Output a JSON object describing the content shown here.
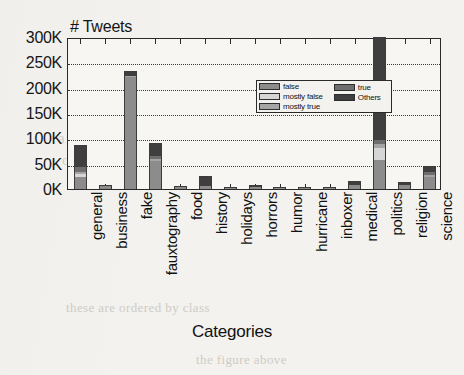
{
  "figure": {
    "y_axis_title": "# Tweets",
    "x_axis_title": "Categories"
  },
  "legend": {
    "left_column": [
      {
        "label": "false",
        "color": "#8c8c8c"
      },
      {
        "label": "mostly false",
        "color": "#d6d6d6"
      },
      {
        "label": "mostly true",
        "color": "#a5a5a5"
      }
    ],
    "right_column": [
      {
        "label": "true",
        "color": "#6e6e6e"
      },
      {
        "label": "Others",
        "color": "#3f3f3f"
      }
    ]
  },
  "ghost_text": {
    "line1": "and supporters among",
    "line2": "a representative sample of",
    "line3": "of the tweets we collect",
    "line4": "these are ordered by class",
    "line5": "the figure above"
  },
  "chart_data": {
    "type": "bar",
    "title": "",
    "subtitle": "",
    "xlabel": "Categories",
    "ylabel": "# Tweets",
    "stacked": true,
    "grid": true,
    "legend_position": "inside-top-center",
    "ylim": [
      0,
      300000
    ],
    "ytick_values": [
      0,
      50000,
      100000,
      150000,
      200000,
      250000,
      300000
    ],
    "ytick_labels": [
      "0K",
      "50K",
      "100K",
      "150K",
      "200K",
      "250K",
      "300K"
    ],
    "categories": [
      "general",
      "business",
      "fake",
      "fauxtography",
      "food",
      "history",
      "holidays",
      "horrors",
      "humor",
      "hurricane",
      "inboxer",
      "medical",
      "politics",
      "religion",
      "science"
    ],
    "series": [
      {
        "name": "false",
        "color": "#8c8c8c",
        "values": [
          23000,
          6000,
          222000,
          56000,
          3000,
          6000,
          2000,
          4000,
          1000,
          1000,
          2000,
          7000,
          57000,
          8000,
          24000
        ]
      },
      {
        "name": "mostly false",
        "color": "#d6d6d6",
        "values": [
          6000,
          0,
          0,
          0,
          0,
          0,
          0,
          0,
          0,
          0,
          0,
          0,
          23000,
          0,
          0
        ]
      },
      {
        "name": "mostly true",
        "color": "#a5a5a5",
        "values": [
          5000,
          0,
          2000,
          4000,
          0,
          0,
          0,
          0,
          0,
          0,
          0,
          0,
          9000,
          0,
          4000
        ]
      },
      {
        "name": "true",
        "color": "#6e6e6e",
        "values": [
          9000,
          0,
          0,
          6000,
          0,
          0,
          0,
          0,
          0,
          0,
          0,
          0,
          7000,
          0,
          5000
        ]
      },
      {
        "name": "Others",
        "color": "#3f3f3f",
        "values": [
          43000,
          2000,
          8000,
          25000,
          1000,
          20000,
          1000,
          3000,
          1000,
          1000,
          1000,
          9000,
          204000,
          5000,
          12000
        ]
      }
    ],
    "totals": [
      86000,
      8000,
      232000,
      91000,
      4000,
      26000,
      3000,
      7000,
      2000,
      2000,
      3000,
      16000,
      300000,
      13000,
      45000
    ]
  }
}
